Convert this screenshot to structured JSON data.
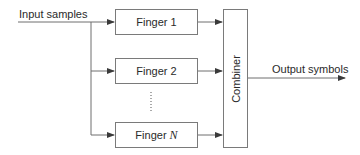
{
  "diagram": {
    "input_label": "Input samples",
    "output_label": "Output symbols",
    "fingers": [
      {
        "label": "Finger",
        "index": "1",
        "index_italic": false
      },
      {
        "label": "Finger",
        "index": "2",
        "index_italic": false
      },
      {
        "label": "Finger",
        "index": "N",
        "index_italic": true
      }
    ],
    "ellipsis": "vertical-dots",
    "combiner_label": "Combiner",
    "colors": {
      "line": "#6e6e6e",
      "box_border": "#7a7a7a",
      "text": "#2a2a2a"
    }
  }
}
